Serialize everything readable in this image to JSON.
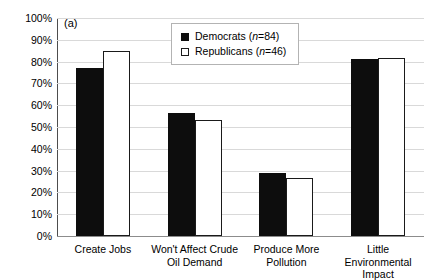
{
  "figure": {
    "panel_label": "(a)"
  },
  "legend": {
    "position": "top-center",
    "entries": [
      {
        "label_prefix": "Democrats (",
        "n_symbol": "n",
        "n_value": "=84)",
        "full": "Democrats (n=84)",
        "swatch": "filled-black-square"
      },
      {
        "label_prefix": "Republicans (",
        "n_symbol": "n",
        "n_value": "=46)",
        "full": "Republicans (n=46)",
        "swatch": "open-white-square"
      }
    ]
  },
  "chart_data": {
    "type": "bar",
    "title": "",
    "subtitle": "",
    "xlabel": "",
    "ylabel": "",
    "ylim": [
      0,
      100
    ],
    "ytick_labels": [
      "100%",
      "90%",
      "80%",
      "70%",
      "60%",
      "50%",
      "40%",
      "30%",
      "20%",
      "10%",
      "0%"
    ],
    "ytick_values": [
      100,
      90,
      80,
      70,
      60,
      50,
      40,
      30,
      20,
      10,
      0
    ],
    "grid": true,
    "grid_orientation": "horizontal",
    "legend_position": "top-center",
    "categories": [
      "Create Jobs",
      "Won't Affect Crude Oil Demand",
      "Produce More Pollution",
      "Little Environmental Impact"
    ],
    "series": [
      {
        "name": "Democrats (n=84)",
        "color": "#0d0d0d",
        "values": [
          77,
          56.5,
          29,
          81
        ]
      },
      {
        "name": "Republicans (n=46)",
        "color": "#ffffff",
        "values": [
          85,
          53,
          26.5,
          81.5
        ]
      }
    ]
  },
  "colors": {
    "democrat_fill": "#0d0d0d",
    "republican_fill": "#ffffff",
    "bar_outline": "#1a1a1a",
    "gridline": "#d9d9d9",
    "axis": "#4d4d4d",
    "background": "#ffffff"
  }
}
